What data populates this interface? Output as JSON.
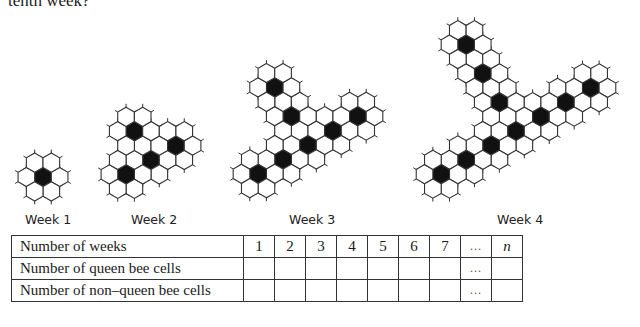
{
  "intro_text": "tenth week?",
  "figures": [
    {
      "label": "Week 1",
      "label_x": 25,
      "center": [
        43,
        177
      ],
      "queens": [
        [
          0,
          0
        ]
      ]
    },
    {
      "label": "Week 2",
      "label_x": 131,
      "center": [
        151,
        160
      ],
      "queens": [
        [
          0,
          0
        ],
        [
          0,
          -2
        ],
        [
          -2,
          1
        ],
        [
          2,
          -1
        ]
      ]
    },
    {
      "label": "Week 3",
      "label_x": 289,
      "center": [
        308,
        145
      ],
      "queens": [
        [
          0,
          0
        ],
        [
          0,
          -2
        ],
        [
          0,
          -4
        ],
        [
          -2,
          1
        ],
        [
          -4,
          2
        ],
        [
          2,
          -1
        ],
        [
          4,
          -2
        ]
      ]
    },
    {
      "label": "Week 4",
      "label_x": 497,
      "center": [
        516,
        131
      ],
      "queens": [
        [
          0,
          0
        ],
        [
          0,
          -2
        ],
        [
          0,
          -4
        ],
        [
          0,
          -6
        ],
        [
          -2,
          1
        ],
        [
          -4,
          2
        ],
        [
          -6,
          3
        ],
        [
          2,
          -1
        ],
        [
          4,
          -2
        ],
        [
          6,
          -3
        ]
      ]
    }
  ],
  "table": {
    "header_label": "Number of weeks",
    "columns": [
      "1",
      "2",
      "3",
      "4",
      "5",
      "6",
      "7",
      "...",
      "n"
    ],
    "rows": [
      {
        "label": "Number of queen bee cells",
        "cells": [
          "",
          "",
          "",
          "",
          "",
          "",
          "",
          "...",
          ""
        ]
      },
      {
        "label": "Number of non–queen bee cells",
        "cells": [
          "",
          "",
          "",
          "",
          "",
          "",
          "",
          "...",
          ""
        ]
      }
    ]
  },
  "colors": {
    "queen_cell": "#111111",
    "cell_stroke": "#333333",
    "cell_fill": "#ffffff"
  }
}
